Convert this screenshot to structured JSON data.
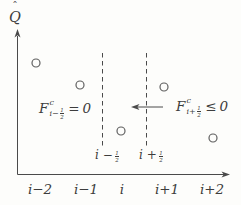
{
  "figure": {
    "ink_color": "#4a4a4a",
    "point_color": "#5f5f5f",
    "paper_color": "#fdfdfb",
    "y_axis_label": {
      "hat": "ˆ",
      "letter": "Q"
    },
    "axes": {
      "origin_x": 17.5,
      "origin_y": 174.5,
      "x_arrow_tip_x": 230,
      "y_arrow_tip_y": 29
    },
    "x_ticks": [
      {
        "label": "i−2",
        "x": 40
      },
      {
        "label": "i−1",
        "x": 86
      },
      {
        "label": "i",
        "x": 122
      },
      {
        "label": "i+1",
        "x": 167
      },
      {
        "label": "i+2",
        "x": 212
      }
    ],
    "interface_lines": [
      {
        "x": 102.5,
        "y_top": 53,
        "y_bottom": 146
      },
      {
        "x": 146.5,
        "y_top": 53,
        "y_bottom": 146
      }
    ],
    "interface_labels": [
      {
        "prefix": "i −",
        "frac_num": "1",
        "frac_den": "2"
      },
      {
        "prefix": "i +",
        "frac_num": "1",
        "frac_den": "2"
      }
    ],
    "points": [
      {
        "grid_index": "i−2",
        "x": 36,
        "y": 63
      },
      {
        "grid_index": "i−1",
        "x": 80,
        "y": 85
      },
      {
        "grid_index": "i",
        "x": 121,
        "y": 131
      },
      {
        "grid_index": "i+1",
        "x": 164,
        "y": 87
      },
      {
        "grid_index": "i+2",
        "x": 213,
        "y": 138
      }
    ],
    "point_radius": 4,
    "flux_arrow": {
      "x_head": 131,
      "x_tail": 163,
      "y": 107
    },
    "formulas": {
      "left": {
        "base": "F",
        "sup": "c",
        "sub_prefix": "i−",
        "frac_num": "1",
        "frac_den": "2",
        "relation": "=",
        "rhs": "0"
      },
      "right": {
        "base": "F",
        "sup": "c",
        "sub_prefix": "i+",
        "frac_num": "1",
        "frac_den": "2",
        "relation": "≤",
        "rhs": "0"
      }
    }
  }
}
